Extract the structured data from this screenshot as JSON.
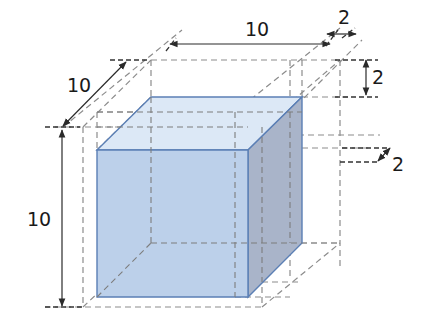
{
  "diagram": {
    "colors": {
      "front_face": "#bcd0ea",
      "top_face": "#dce8f6",
      "right_face": "#a9b4c9",
      "cube_edge": "#5b7fb5",
      "dashed": "#8c8c8c",
      "dim_line": "#2a2a2a",
      "text": "#1a1a1a"
    },
    "labels": {
      "width_label": "10",
      "width_extra_label": "2",
      "height_extra_label": "2",
      "depth_extra_label": "2",
      "depth_label": "10",
      "height_label": "10"
    },
    "cube": {
      "front": [
        [
          97,
          150
        ],
        [
          248,
          150
        ],
        [
          248,
          297
        ],
        [
          97,
          297
        ]
      ],
      "back_offset": [
        54,
        -53
      ]
    }
  }
}
